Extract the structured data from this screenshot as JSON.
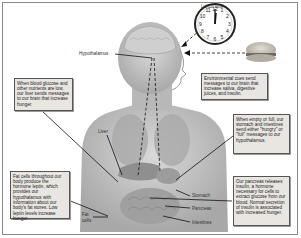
{
  "diagram": {
    "clock_label": "Lunch time",
    "clock_numbers": [
      "12",
      "1",
      "2",
      "3",
      "4",
      "5",
      "6",
      "7",
      "8",
      "9",
      "10",
      "11"
    ],
    "labels": {
      "hypothalamus": "Hypothalamus",
      "liver": "Liver",
      "stomach": "Stomach",
      "pancreas": "Pancreas",
      "intestines": "Intestines",
      "fat_cells_line1": "Fat",
      "fat_cells_line2": "cells"
    },
    "notes": {
      "liver_note": "When blood glucose and other nutrients are low, our liver sends messages to our brain that increase hunger.",
      "environment_note": "Environmental cues send messages to our brain that increase saliva, digestive juices, and insulin.",
      "stomach_note": "When empty or full, our stomach and intestines send either \"hungry\" or \"full\" messages to our hypothalamus.",
      "fat_note": "Fat cells throughout our body produce the hormone leptin, which provides our hypothalamus with information about our body's fat stores. Low leptin levels increase hunger.",
      "pancreas_note": "Our pancreas releases insulin, a hormone necessary for cells to extract glucose from our blood. Normal secretion of insulin is associated with increased hunger."
    },
    "colors": {
      "note_bg": "#e9e6e2",
      "note_border": "#555555",
      "body_gray": "#bdbdbd",
      "line": "#111111"
    }
  }
}
